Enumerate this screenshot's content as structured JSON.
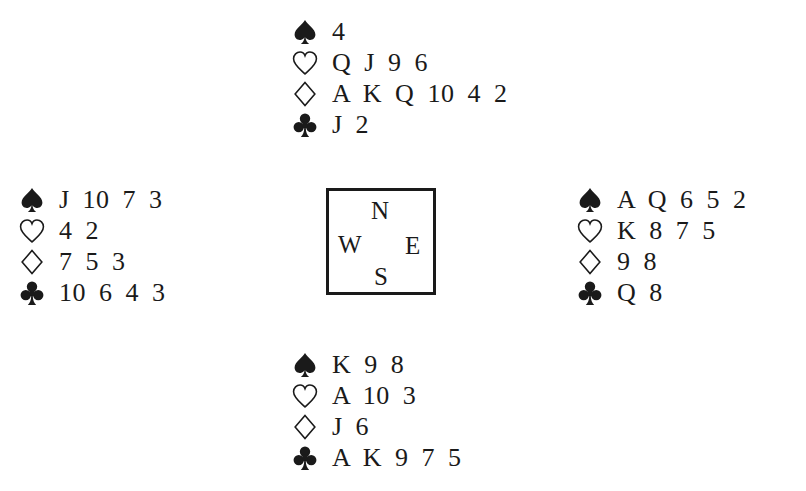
{
  "diagram": {
    "type": "bridge-deal",
    "ink_color": "#1a1a1a",
    "background": "#ffffff"
  },
  "compass": {
    "north": "N",
    "west": "W",
    "east": "E",
    "south": "S"
  },
  "hands": {
    "north": {
      "spades": "4",
      "hearts": "Q J 9 6",
      "diamonds": "A K Q 10 4 2",
      "clubs": "J 2"
    },
    "west": {
      "spades": "J 10 7 3",
      "hearts": "4 2",
      "diamonds": "7 5 3",
      "clubs": "10 6 4 3"
    },
    "east": {
      "spades": "A Q 6 5 2",
      "hearts": "K 8 7 5",
      "diamonds": "9 8",
      "clubs": "Q 8"
    },
    "south": {
      "spades": "K 9 8",
      "hearts": "A 10 3",
      "diamonds": "J 6",
      "clubs": "A K 9 7 5"
    }
  },
  "suit_icons": {
    "spades": "spade-icon (filled)",
    "hearts": "heart-icon (outline)",
    "diamonds": "diamond-icon (outline)",
    "clubs": "club-icon (filled)"
  }
}
